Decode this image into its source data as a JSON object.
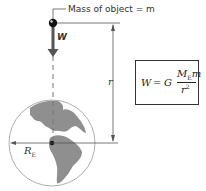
{
  "labels": {
    "mass": "Mass of object = m",
    "weight": "W",
    "distance": "r",
    "earth_radius": "R",
    "earth_radius_sub": "E"
  },
  "formula": {
    "lhs": "W",
    "equals": "=",
    "constant": "G",
    "numerator_mass": "M",
    "numerator_sub": "E",
    "numerator_m": "m",
    "denominator": "r",
    "denominator_exp": "2"
  },
  "colors": {
    "earth_land": "#8a8a8a",
    "earth_ocean": "#ffffff",
    "arrow": "#555555",
    "line": "#555555"
  }
}
